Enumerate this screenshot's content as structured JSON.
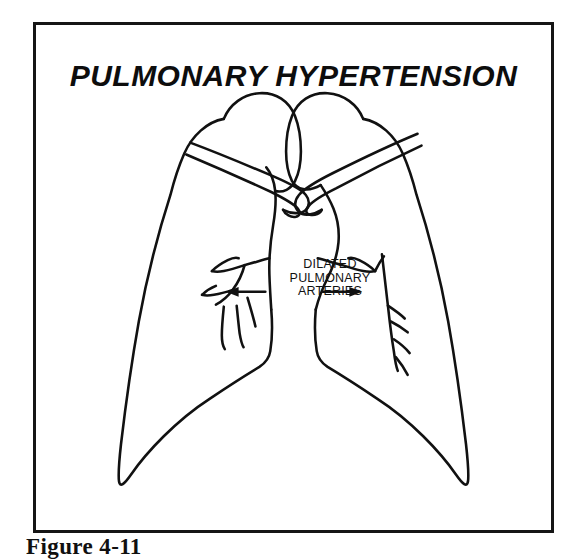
{
  "figure": {
    "title": "PULMONARY HYPERTENSION",
    "caption": "Figure 4-11",
    "frame_color": "#151515",
    "background_color": "#ffffff",
    "ink_color": "#111111"
  },
  "annotation": {
    "line1": "DILATED",
    "line2": "PULMONARY",
    "line3": "ARTERIES",
    "left_arrow_name": "arrow-left",
    "right_arrow_name": "arrow-right"
  },
  "anatomy": {
    "left_lung": "left-lung-outline",
    "right_lung": "right-lung-outline",
    "left_clavicle": "left-clavicle",
    "right_clavicle": "right-clavicle",
    "left_artery": "left-dilated-pulmonary-artery",
    "right_artery": "right-dilated-pulmonary-artery"
  }
}
